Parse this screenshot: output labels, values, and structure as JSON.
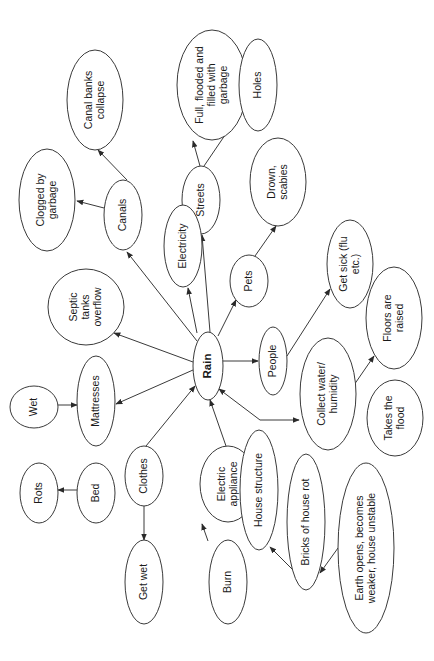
{
  "diagram": {
    "type": "concept-map",
    "orientation": "rotated-90-ccw",
    "center": "rain",
    "colors": {
      "stroke": "#3a3a3a",
      "text": "#1a1a1a",
      "background": "#ffffff"
    },
    "nodes": [
      {
        "id": "rain",
        "lines": [
          "Rain"
        ],
        "cx": 208,
        "cy": 366,
        "rx": 15,
        "ry": 34,
        "center": true
      },
      {
        "id": "canals",
        "lines": [
          "Canals"
        ],
        "cx": 123,
        "cy": 215,
        "rx": 19,
        "ry": 35
      },
      {
        "id": "canal-banks-collapse",
        "lines": [
          "Canal banks",
          "collapse"
        ],
        "cx": 95,
        "cy": 100,
        "rx": 28,
        "ry": 50
      },
      {
        "id": "clogged-by-garbage",
        "lines": [
          "Clogged by",
          "garbage"
        ],
        "cx": 47,
        "cy": 200,
        "rx": 28,
        "ry": 51
      },
      {
        "id": "streets",
        "lines": [
          "Streets"
        ],
        "cx": 201,
        "cy": 200,
        "rx": 19,
        "ry": 34
      },
      {
        "id": "full-flooded",
        "lines": [
          "Full, flooded and",
          "filled with",
          "garbage"
        ],
        "cx": 212,
        "cy": 85,
        "rx": 35,
        "ry": 55
      },
      {
        "id": "holes",
        "lines": [
          "Holes"
        ],
        "cx": 258,
        "cy": 85,
        "rx": 19,
        "ry": 46
      },
      {
        "id": "electricity",
        "lines": [
          "Electricity"
        ],
        "cx": 183,
        "cy": 246,
        "rx": 19,
        "ry": 41
      },
      {
        "id": "pets",
        "lines": [
          "Pets"
        ],
        "cx": 249,
        "cy": 281,
        "rx": 19,
        "ry": 26
      },
      {
        "id": "drown-scabies",
        "lines": [
          "Drown,",
          "scabies"
        ],
        "cx": 278,
        "cy": 182,
        "rx": 28,
        "ry": 44
      },
      {
        "id": "septic-tanks-overflow",
        "lines": [
          "Septic",
          "tanks",
          "overflow"
        ],
        "cx": 86,
        "cy": 307,
        "rx": 38,
        "ry": 38
      },
      {
        "id": "mattresses",
        "lines": [
          "Mattresses"
        ],
        "cx": 96,
        "cy": 401,
        "rx": 19,
        "ry": 45
      },
      {
        "id": "wet",
        "lines": [
          "Wet"
        ],
        "cx": 34,
        "cy": 407,
        "rx": 24,
        "ry": 21
      },
      {
        "id": "people",
        "lines": [
          "People"
        ],
        "cx": 273,
        "cy": 361,
        "rx": 14,
        "ry": 34
      },
      {
        "id": "get-sick",
        "lines": [
          "Get sick (flu",
          "etc.)"
        ],
        "cx": 350,
        "cy": 264,
        "rx": 23,
        "ry": 44
      },
      {
        "id": "collect-water",
        "lines": [
          "Collect water/",
          "humidity"
        ],
        "cx": 328,
        "cy": 394,
        "rx": 28,
        "ry": 56
      },
      {
        "id": "floors-raised",
        "lines": [
          "Floors are",
          "raised"
        ],
        "cx": 394,
        "cy": 318,
        "rx": 28,
        "ry": 51
      },
      {
        "id": "takes-the-flood",
        "lines": [
          "Takes the",
          "flood"
        ],
        "cx": 395,
        "cy": 418,
        "rx": 28,
        "ry": 38
      },
      {
        "id": "clothes",
        "lines": [
          "Clothes"
        ],
        "cx": 144,
        "cy": 476,
        "rx": 19,
        "ry": 30
      },
      {
        "id": "bed",
        "lines": [
          "Bed"
        ],
        "cx": 96,
        "cy": 493,
        "rx": 19,
        "ry": 30
      },
      {
        "id": "rots",
        "lines": [
          "Rots"
        ],
        "cx": 39,
        "cy": 493,
        "rx": 19,
        "ry": 30
      },
      {
        "id": "get-wet",
        "lines": [
          "Get wet"
        ],
        "cx": 144,
        "cy": 582,
        "rx": 19,
        "ry": 42
      },
      {
        "id": "electric-appliance",
        "lines": [
          "Electric",
          "appliance"
        ],
        "cx": 228,
        "cy": 484,
        "rx": 28,
        "ry": 38
      },
      {
        "id": "burn",
        "lines": [
          "Burn"
        ],
        "cx": 228,
        "cy": 582,
        "rx": 19,
        "ry": 42
      },
      {
        "id": "house-structure",
        "lines": [
          "House structure"
        ],
        "cx": 259,
        "cy": 490,
        "rx": 19,
        "ry": 60
      },
      {
        "id": "bricks-of-house-rot",
        "lines": [
          "Bricks of house rot"
        ],
        "cx": 306,
        "cy": 522,
        "rx": 19,
        "ry": 68
      },
      {
        "id": "earth-opens",
        "lines": [
          "Earth opens, becomes",
          "weaker, house unstable"
        ],
        "cx": 366,
        "cy": 548,
        "rx": 28,
        "ry": 85
      }
    ],
    "edges": [
      {
        "from": "rain",
        "to": "canals",
        "x1": 197,
        "y1": 341,
        "x2": 127,
        "y2": 252
      },
      {
        "from": "canals",
        "to": "canal-banks-collapse",
        "x1": 127,
        "y1": 180,
        "x2": 98,
        "y2": 150
      },
      {
        "from": "canals",
        "to": "clogged-by-garbage",
        "x1": 104,
        "y1": 208,
        "x2": 77,
        "y2": 201
      },
      {
        "from": "rain",
        "to": "streets",
        "x1": 210,
        "y1": 332,
        "x2": 202,
        "y2": 235
      },
      {
        "from": "streets",
        "to": "full-flooded",
        "x1": 200,
        "y1": 166,
        "x2": 193,
        "y2": 141
      },
      {
        "from": "streets",
        "to": "holes",
        "x1": 204,
        "y1": 166,
        "x2": 240,
        "y2": 113
      },
      {
        "from": "rain",
        "to": "electricity",
        "x1": 197,
        "y1": 333,
        "x2": 188,
        "y2": 288
      },
      {
        "from": "rain",
        "to": "pets",
        "x1": 218,
        "y1": 336,
        "x2": 236,
        "y2": 300
      },
      {
        "from": "pets",
        "to": "drown-scabies",
        "x1": 255,
        "y1": 256,
        "x2": 276,
        "y2": 226
      },
      {
        "from": "rain",
        "to": "septic-tanks-overflow",
        "x1": 193,
        "y1": 362,
        "x2": 114,
        "y2": 333
      },
      {
        "from": "rain",
        "to": "mattresses",
        "x1": 193,
        "y1": 370,
        "x2": 116,
        "y2": 404
      },
      {
        "from": "wet",
        "to": "mattresses",
        "x1": 58,
        "y1": 405,
        "x2": 77,
        "y2": 405
      },
      {
        "from": "rain",
        "to": "people",
        "x1": 223,
        "y1": 361,
        "x2": 258,
        "y2": 361
      },
      {
        "from": "people",
        "to": "get-sick",
        "x1": 287,
        "y1": 356,
        "x2": 330,
        "y2": 289
      },
      {
        "from": "collect-water",
        "to": "floors-raised",
        "x1": 354,
        "y1": 385,
        "x2": 374,
        "y2": 356
      },
      {
        "from": "house-structure",
        "to": "collect-water",
        "x1": 260,
        "y1": 420,
        "x2": 299,
        "y2": 420
      },
      {
        "from": "house-structure",
        "to": "rain",
        "x1": 260,
        "y1": 420,
        "x2": 219,
        "y2": 389
      },
      {
        "from": "clothes",
        "to": "rain",
        "x1": 146,
        "y1": 446,
        "x2": 195,
        "y2": 386
      },
      {
        "from": "electric-appliance",
        "to": "rain",
        "x1": 226,
        "y1": 446,
        "x2": 210,
        "y2": 400
      },
      {
        "from": "bed",
        "to": "rots",
        "x1": 77,
        "y1": 490,
        "x2": 58,
        "y2": 490
      },
      {
        "from": "clothes",
        "to": "get-wet",
        "x1": 144,
        "y1": 506,
        "x2": 144,
        "y2": 540
      },
      {
        "from": "burn",
        "to": "electric-appliance",
        "x1": 208,
        "y1": 541,
        "x2": 202,
        "y2": 524
      },
      {
        "from": "bricks-of-house-rot",
        "to": "house-structure",
        "x1": 293,
        "y1": 570,
        "x2": 270,
        "y2": 547
      },
      {
        "from": "earth-opens",
        "to": "bricks-of-house-rot",
        "x1": 338,
        "y1": 548,
        "x2": 320,
        "y2": 573
      }
    ]
  }
}
